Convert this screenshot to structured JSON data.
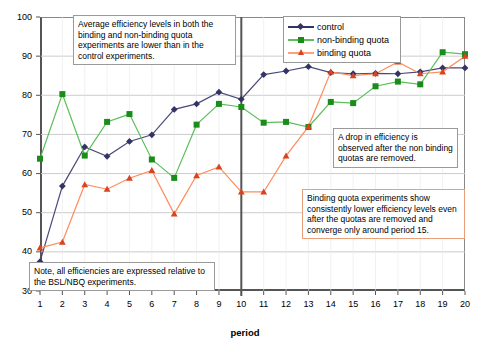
{
  "chart_data": {
    "type": "line",
    "title": "",
    "xlabel": "period",
    "ylabel": "",
    "xlim": [
      1,
      20
    ],
    "ylim": [
      30,
      100
    ],
    "ytick_step": 10,
    "grid": true,
    "legend_position": "top-right",
    "x": [
      1,
      2,
      3,
      4,
      5,
      6,
      7,
      8,
      9,
      10,
      11,
      12,
      13,
      14,
      15,
      16,
      17,
      18,
      19,
      20
    ],
    "categories": [
      "1",
      "2",
      "3",
      "4",
      "5",
      "6",
      "7",
      "8",
      "9",
      "10",
      "11",
      "12",
      "13",
      "14",
      "15",
      "16",
      "17",
      "18",
      "19",
      "20"
    ],
    "yticks": [
      "30",
      "40",
      "50",
      "60",
      "70",
      "80",
      "90",
      "100"
    ],
    "series": [
      {
        "name": "control",
        "color": "#333366",
        "marker": "diamond",
        "values": [
          37.5,
          56.8,
          66.8,
          64.4,
          68.2,
          69.9,
          76.4,
          77.8,
          80.8,
          79.0,
          85.3,
          86.2,
          87.3,
          85.8,
          85.5,
          85.6,
          85.5,
          86.0,
          87.0,
          87.0
        ]
      },
      {
        "name": "non-binding quota",
        "color": "#1a8c1a",
        "marker": "square",
        "values": [
          63.8,
          80.3,
          64.6,
          73.2,
          75.2,
          63.6,
          58.9,
          72.5,
          77.8,
          77.0,
          73.0,
          73.2,
          71.9,
          78.3,
          78.0,
          82.3,
          83.5,
          82.8,
          91.0,
          90.5
        ]
      },
      {
        "name": "binding quota",
        "color": "#ff6633",
        "marker": "triangle",
        "values": [
          41.0,
          42.5,
          57.2,
          56.0,
          58.8,
          60.8,
          49.7,
          59.5,
          61.7,
          55.3,
          55.3,
          64.5,
          72.0,
          86.0,
          85.0,
          85.5,
          88.5,
          85.5,
          86.0,
          90.0
        ]
      }
    ],
    "divider_at_period": 10
  },
  "legend": {
    "items": [
      {
        "label": "control"
      },
      {
        "label": "non-binding quota"
      },
      {
        "label": "binding quota"
      }
    ]
  },
  "axes": {
    "x_title": "period"
  },
  "annotations": {
    "top": "Average efficiency levels in both the binding and non-binding quota experiments are lower than in the control experiments.",
    "bottom_left": "Note, all efficiencies are expressed relative to the BSL/NBQ experiments.",
    "drop": "A drop in efficiency is observed after the non binding quotas are removed.",
    "binding": "Binding quota experiments show consistently lower efficiency levels even after the quotas are removed and converge only around period 15."
  }
}
